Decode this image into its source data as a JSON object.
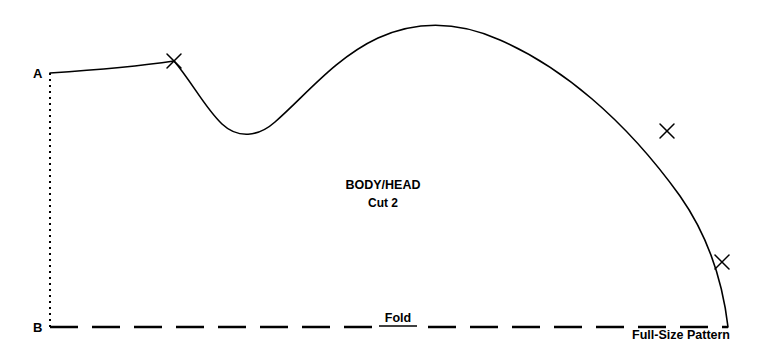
{
  "document": {
    "type": "sewing-pattern-piece",
    "width": 772,
    "height": 358,
    "background_color": "#ffffff",
    "line_color": "#000000"
  },
  "labels": {
    "point_a": "A",
    "point_b": "B",
    "piece_name": "BODY/HEAD",
    "cut_quantity": "Cut 2",
    "fold": "Fold",
    "size_note": "Full-Size Pattern"
  },
  "chart_data": {
    "type": "line",
    "title": "BODY/HEAD Cut 2",
    "xlabel": "",
    "ylabel": "",
    "xlim": [
      0,
      772
    ],
    "ylim": [
      358,
      0
    ],
    "grid": false,
    "legend": false,
    "annotations": [
      {
        "text": "A",
        "x": 40,
        "y": 78,
        "bold": true
      },
      {
        "text": "B",
        "x": 40,
        "y": 331,
        "bold": true
      },
      {
        "text": "BODY/HEAD",
        "x": 383,
        "y": 188,
        "bold": true
      },
      {
        "text": "Cut 2",
        "x": 383,
        "y": 206,
        "bold": true
      },
      {
        "text": "Fold",
        "x": 398,
        "y": 321,
        "bold": true,
        "underline": true
      },
      {
        "text": "Full-Size Pattern",
        "x": 728,
        "y": 339,
        "bold": true
      }
    ],
    "series": [
      {
        "name": "cutting-line",
        "style": "solid",
        "path": "M 50 73 C 95 70 140 66 174 61 C 192 82 205 108 222 124 C 238 139 258 137 275 122 C 305 96 335 58 378 38 C 420 19 462 23 500 40 C 560 66 624 118 680 196 C 706 233 722 276 728 327",
        "points": [
          {
            "x": 50,
            "y": 73,
            "label": "A"
          },
          {
            "x": 174,
            "y": 61,
            "label": "notch-1"
          },
          {
            "x": 248,
            "y": 133,
            "label": "valley"
          },
          {
            "x": 463,
            "y": 25,
            "label": "peak"
          },
          {
            "x": 667,
            "y": 131,
            "label": "notch-2"
          },
          {
            "x": 722,
            "y": 262,
            "label": "notch-3"
          },
          {
            "x": 728,
            "y": 327,
            "label": "end"
          }
        ]
      },
      {
        "name": "fold-line",
        "style": "dashed",
        "dash_pattern": "28 14",
        "x_start": 50,
        "x_end": 728,
        "y": 327
      },
      {
        "name": "grain-line",
        "style": "dotted",
        "dash_pattern": "2 4",
        "x": 50,
        "y_start": 73,
        "y_end": 327
      }
    ],
    "markers": [
      {
        "type": "x-notch",
        "x": 174,
        "y": 61,
        "rotation": 20
      },
      {
        "type": "x-notch",
        "x": 667,
        "y": 131,
        "rotation": 10
      },
      {
        "type": "x-notch",
        "x": 722,
        "y": 262,
        "rotation": 5
      }
    ]
  }
}
